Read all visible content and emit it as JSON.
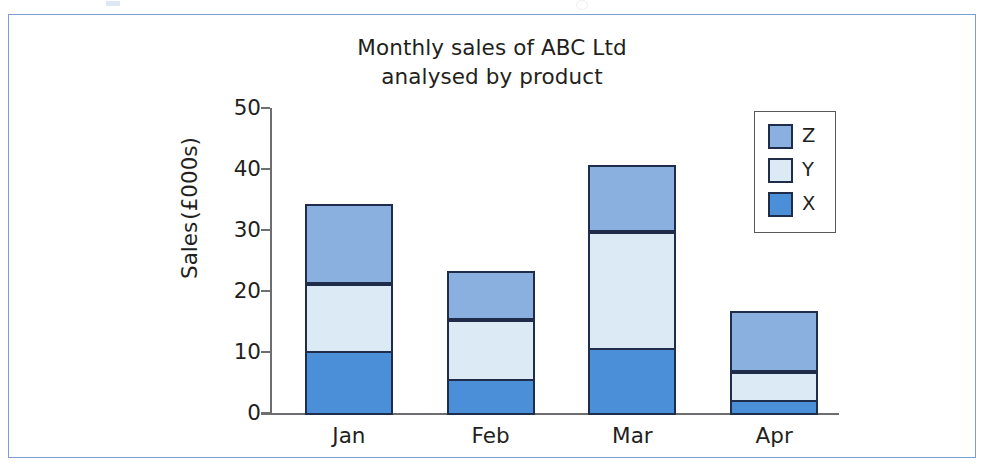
{
  "figure": {
    "frame_border_color": "#7b9fd4",
    "background_color": "#ffffff"
  },
  "chart_data": {
    "type": "bar",
    "subtype": "stacked-vertical",
    "title": "Monthly sales of ABC Ltd analysed by product",
    "title_lines": [
      "Monthly sales of ABC Ltd",
      "analysed by product"
    ],
    "xlabel": "",
    "ylabel": "Sales (£000s)",
    "ylabel_lines": [
      "Sales",
      "(£000s)"
    ],
    "categories": [
      "Jan",
      "Feb",
      "Mar",
      "Apr"
    ],
    "ylim": [
      0,
      50
    ],
    "yticks": [
      0,
      10,
      20,
      30,
      40,
      50
    ],
    "ytick_labels": [
      "0",
      "10",
      "20",
      "30",
      "40",
      "50"
    ],
    "grid": false,
    "legend_position": "top-right",
    "stack_order_bottom_to_top": [
      "X",
      "Y",
      "Z"
    ],
    "series": [
      {
        "name": "X",
        "color": "#4a8fd8",
        "values": [
          10.5,
          6.0,
          11.0,
          2.5
        ]
      },
      {
        "name": "Y",
        "color": "#dbeaf5",
        "values": [
          11.5,
          10.0,
          19.5,
          5.0
        ]
      },
      {
        "name": "Z",
        "color": "#8ab0e0",
        "values": [
          13.0,
          8.0,
          11.0,
          10.0
        ]
      }
    ],
    "cumulative_tops": {
      "Jan": [
        10.5,
        22.0,
        35.0
      ],
      "Feb": [
        6.0,
        16.0,
        24.0
      ],
      "Mar": [
        11.0,
        30.5,
        41.5
      ],
      "Apr": [
        2.5,
        7.5,
        17.5
      ]
    },
    "totals": [
      35.0,
      24.0,
      41.5,
      17.5
    ],
    "segment_border_color": "#1f2d4a",
    "axis_color": "#6d6e71"
  },
  "legend": {
    "border_color": "#58595b",
    "items": [
      {
        "label": "Z",
        "color": "#8ab0e0"
      },
      {
        "label": "Y",
        "color": "#dbeaf5"
      },
      {
        "label": "X",
        "color": "#4a8fd8"
      }
    ]
  }
}
